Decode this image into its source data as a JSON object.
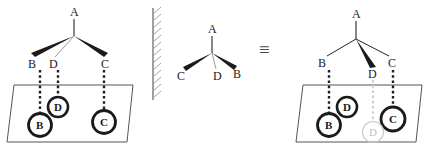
{
  "figure": {
    "equivalence_symbol": "≡",
    "colors": {
      "stroke": "#262626",
      "bold_wedge": "#1a1a1a",
      "faint_gray": "#c8c8c8",
      "plane_outline": "#555555",
      "mirror_hatch": "#9a9a9a",
      "background": "#ffffff"
    }
  },
  "left_panel": {
    "name": "original-structure",
    "apex_label": "A",
    "branch_labels": [
      "B",
      "D",
      "C"
    ],
    "plane_circle_labels": [
      "B",
      "D",
      "C"
    ],
    "bond_styles": [
      "bold-wedge",
      "plain-line",
      "bold-wedge"
    ]
  },
  "mirror": {
    "name": "mirror-plane",
    "hatch_count": 13
  },
  "middle_panel": {
    "name": "reflected-structure",
    "apex_label": "A",
    "branch_labels": [
      "C",
      "D",
      "B"
    ],
    "bond_styles": [
      "bold-wedge",
      "plain-line",
      "bold-wedge"
    ]
  },
  "right_panel": {
    "name": "redrawn-structure",
    "apex_label": "A",
    "branch_labels": [
      "B",
      "D",
      "C"
    ],
    "plane_circle_labels": [
      "B",
      "D",
      "C"
    ],
    "ghost_circle_label": "D",
    "bond_styles": [
      "plain-line",
      "bold-wedge",
      "plain-line"
    ]
  }
}
